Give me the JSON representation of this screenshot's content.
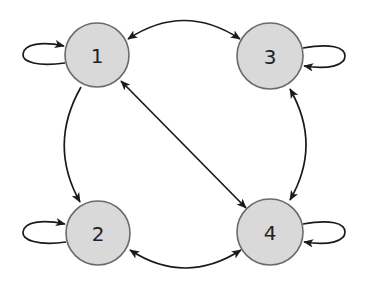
{
  "diagram": {
    "type": "directed-graph",
    "nodes": [
      {
        "id": "1",
        "label": "1",
        "cx": 97,
        "cy": 55,
        "r": 32
      },
      {
        "id": "2",
        "label": "2",
        "cx": 98,
        "cy": 233,
        "r": 32
      },
      {
        "id": "3",
        "label": "3",
        "cx": 270,
        "cy": 56,
        "r": 33
      },
      {
        "id": "4",
        "label": "4",
        "cx": 270,
        "cy": 232,
        "r": 33
      }
    ],
    "edges": [
      {
        "from": "1",
        "to": "1",
        "kind": "self-loop"
      },
      {
        "from": "2",
        "to": "2",
        "kind": "self-loop"
      },
      {
        "from": "3",
        "to": "3",
        "kind": "self-loop"
      },
      {
        "from": "4",
        "to": "4",
        "kind": "self-loop"
      },
      {
        "from": "1",
        "to": "2",
        "kind": "directed"
      },
      {
        "from": "1",
        "to": "3",
        "kind": "bidirectional"
      },
      {
        "from": "1",
        "to": "4",
        "kind": "bidirectional"
      },
      {
        "from": "3",
        "to": "4",
        "kind": "bidirectional"
      },
      {
        "from": "2",
        "to": "4",
        "kind": "bidirectional"
      }
    ],
    "colors": {
      "node_fill": "#d9d9d9",
      "node_stroke": "#6a6a6a",
      "edge": "#1a1a1a"
    }
  }
}
